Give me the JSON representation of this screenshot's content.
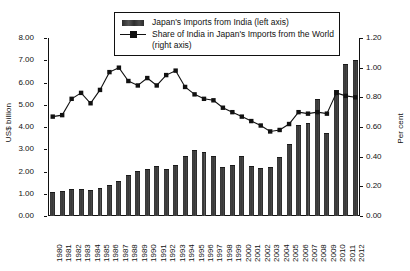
{
  "chart_data": {
    "type": "bar",
    "title": "",
    "subtitle": "",
    "xlabel": "",
    "ylabel": "US$ billion",
    "y2label": "Per cent",
    "grid": false,
    "legend_position": "top-center",
    "ylim": [
      0,
      8
    ],
    "y2lim": [
      0,
      1.2
    ],
    "yticks": [
      "0.00",
      "1.00",
      "2.00",
      "3.00",
      "4.00",
      "5.00",
      "6.00",
      "7.00",
      "8.00"
    ],
    "ytick_values": [
      0,
      1,
      2,
      3,
      4,
      5,
      6,
      7,
      8
    ],
    "y2ticks": [
      "0.00",
      "0.20",
      "0.40",
      "0.60",
      "0.80",
      "1.00",
      "1.20"
    ],
    "y2tick_values": [
      0,
      0.2,
      0.4,
      0.6,
      0.8,
      1.0,
      1.2
    ],
    "categories": [
      "1980",
      "1981",
      "1982",
      "1983",
      "1984",
      "1985",
      "1986",
      "1987",
      "1988",
      "1989",
      "1990",
      "1991",
      "1992",
      "1993",
      "1994",
      "1995",
      "1996",
      "1997",
      "1998",
      "1999",
      "2000",
      "2001",
      "2002",
      "2003",
      "2004",
      "2005",
      "2006",
      "2007",
      "2008",
      "2009",
      "2010",
      "2011",
      "2012"
    ],
    "series": [
      {
        "name": "Japan's Imports from India (left axis)",
        "type": "bar",
        "axis": "left",
        "unit": "US$ billion",
        "color": "#3a3a3a",
        "values": [
          1.04,
          1.08,
          1.15,
          1.15,
          1.14,
          1.21,
          1.33,
          1.54,
          1.81,
          1.96,
          2.08,
          2.2,
          2.06,
          2.27,
          2.66,
          2.93,
          2.85,
          2.67,
          2.18,
          2.23,
          2.63,
          2.21,
          2.11,
          2.17,
          2.61,
          3.18,
          4.05,
          4.15,
          5.22,
          3.7,
          5.64,
          6.8,
          6.95
        ]
      },
      {
        "name": "Share of India in Japan's Imports from the World (right axis)",
        "type": "line",
        "axis": "right",
        "unit": "Per cent",
        "color": "#111111",
        "marker": "square",
        "values": [
          0.67,
          0.68,
          0.79,
          0.83,
          0.76,
          0.85,
          0.97,
          1.0,
          0.91,
          0.88,
          0.93,
          0.88,
          0.95,
          0.98,
          0.87,
          0.82,
          0.79,
          0.78,
          0.73,
          0.7,
          0.67,
          0.64,
          0.61,
          0.57,
          0.58,
          0.62,
          0.7,
          0.69,
          0.7,
          0.69,
          0.83,
          0.81,
          0.8
        ]
      }
    ],
    "legend": [
      {
        "label": "Japan's Imports from India (left axis)",
        "key": "bar-swatch"
      },
      {
        "label": "Share of India in Japan's Imports from the World (right axis)",
        "key": "line-marker-swatch"
      }
    ]
  }
}
